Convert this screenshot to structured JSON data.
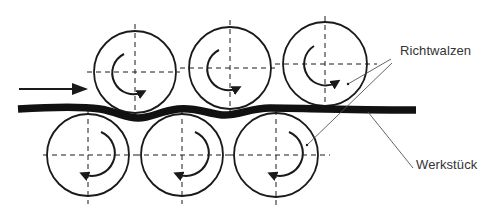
{
  "diagram": {
    "labels": {
      "rollers": "Richtwalzen",
      "workpiece": "Werkstück"
    },
    "colors": {
      "line": "#1a1a1a",
      "leader": "#555555",
      "text": "#333333",
      "background": "#ffffff"
    },
    "feed_direction": "left-to-right",
    "top_rollers": [
      {
        "cx": 135,
        "cy": 72,
        "r": 41,
        "rotation": "clockwise"
      },
      {
        "cx": 230,
        "cy": 68,
        "r": 41,
        "rotation": "clockwise"
      },
      {
        "cx": 325,
        "cy": 64,
        "r": 42,
        "rotation": "clockwise"
      }
    ],
    "bottom_rollers": [
      {
        "cx": 88,
        "cy": 155,
        "r": 41,
        "rotation": "counterclockwise"
      },
      {
        "cx": 182,
        "cy": 155,
        "r": 41,
        "rotation": "counterclockwise"
      },
      {
        "cx": 276,
        "cy": 155,
        "r": 42,
        "rotation": "counterclockwise"
      }
    ]
  }
}
